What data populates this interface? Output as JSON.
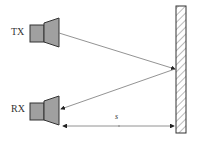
{
  "diagram": {
    "transmitter_label": "TX",
    "receiver_label": "RX",
    "distance_label": "s",
    "colors": {
      "horn_fill": "#a0a0a0",
      "stroke": "#333333",
      "line": "#777777"
    }
  }
}
